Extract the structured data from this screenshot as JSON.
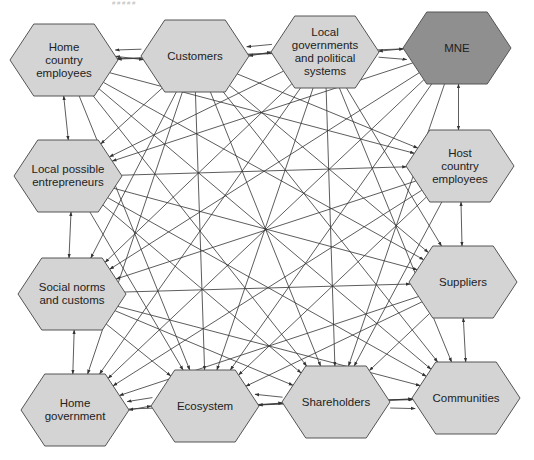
{
  "diagram": {
    "type": "stakeholder-network",
    "header_fragment": "# # # # #",
    "colors": {
      "node_fill": "#d4d4d4",
      "focal_node_fill": "#8f8f8f",
      "node_stroke": "#555555",
      "edge": "#333333",
      "text": "#222222",
      "background": "#ffffff"
    },
    "nodes": [
      {
        "id": "home-country-employees",
        "label": "Home\ncountry\nemployees",
        "cx": 64,
        "cy": 60,
        "focal": false
      },
      {
        "id": "customers",
        "label": "Customers",
        "cx": 195,
        "cy": 56,
        "focal": false
      },
      {
        "id": "local-governments",
        "label": "Local\ngovernments\nand political\nsystems",
        "cx": 325,
        "cy": 52,
        "focal": false
      },
      {
        "id": "mne",
        "label": "MNE",
        "cx": 457,
        "cy": 48,
        "focal": true
      },
      {
        "id": "local-possible-entrepreneurs",
        "label": "Local possible\nentrepreneurs",
        "cx": 68,
        "cy": 176,
        "focal": false
      },
      {
        "id": "host-country-employees",
        "label": "Host\ncountry\nemployees",
        "cx": 460,
        "cy": 166,
        "focal": false
      },
      {
        "id": "social-norms",
        "label": "Social norms\nand customs",
        "cx": 72,
        "cy": 294,
        "focal": false
      },
      {
        "id": "suppliers",
        "label": "Suppliers",
        "cx": 463,
        "cy": 282,
        "focal": false
      },
      {
        "id": "home-government",
        "label": "Home\ngovernment",
        "cx": 75,
        "cy": 410,
        "focal": false
      },
      {
        "id": "ecosystem",
        "label": "Ecosystem",
        "cx": 205,
        "cy": 406,
        "focal": false
      },
      {
        "id": "shareholders",
        "label": "Shareholders",
        "cx": 336,
        "cy": 402,
        "focal": false
      },
      {
        "id": "communities",
        "label": "Communities",
        "cx": 466,
        "cy": 398,
        "focal": false
      }
    ],
    "node_size": {
      "width": 108,
      "height": 72
    },
    "edges": [
      {
        "from": "home-country-employees",
        "to": "customers",
        "bidirectional": true
      },
      {
        "from": "customers",
        "to": "local-governments",
        "bidirectional": true
      },
      {
        "from": "local-governments",
        "to": "mne",
        "bidirectional": true
      },
      {
        "from": "customers",
        "to": "home-country-employees",
        "bidirectional": false
      },
      {
        "from": "local-governments",
        "to": "customers",
        "bidirectional": false
      },
      {
        "from": "local-governments",
        "to": "mne",
        "bidirectional": false
      },
      {
        "from": "home-country-employees",
        "to": "local-possible-entrepreneurs",
        "bidirectional": true
      },
      {
        "from": "local-possible-entrepreneurs",
        "to": "social-norms",
        "bidirectional": true
      },
      {
        "from": "social-norms",
        "to": "home-government",
        "bidirectional": true
      },
      {
        "from": "mne",
        "to": "host-country-employees",
        "bidirectional": true
      },
      {
        "from": "host-country-employees",
        "to": "suppliers",
        "bidirectional": true
      },
      {
        "from": "suppliers",
        "to": "communities",
        "bidirectional": true
      },
      {
        "from": "home-government",
        "to": "ecosystem",
        "bidirectional": true
      },
      {
        "from": "ecosystem",
        "to": "shareholders",
        "bidirectional": true
      },
      {
        "from": "shareholders",
        "to": "communities",
        "bidirectional": false
      },
      {
        "from": "shareholders",
        "to": "communities",
        "bidirectional": false
      },
      {
        "from": "ecosystem",
        "to": "home-government",
        "bidirectional": false
      },
      {
        "from": "shareholders",
        "to": "ecosystem",
        "bidirectional": false
      },
      {
        "from": "home-country-employees",
        "to": "host-country-employees",
        "bidirectional": false
      },
      {
        "from": "home-country-employees",
        "to": "suppliers",
        "bidirectional": false
      },
      {
        "from": "home-country-employees",
        "to": "shareholders",
        "bidirectional": false
      },
      {
        "from": "home-country-employees",
        "to": "ecosystem",
        "bidirectional": false
      },
      {
        "from": "home-country-employees",
        "to": "communities",
        "bidirectional": false
      },
      {
        "from": "customers",
        "to": "local-possible-entrepreneurs",
        "bidirectional": false
      },
      {
        "from": "customers",
        "to": "social-norms",
        "bidirectional": false
      },
      {
        "from": "customers",
        "to": "home-government",
        "bidirectional": false
      },
      {
        "from": "customers",
        "to": "ecosystem",
        "bidirectional": false
      },
      {
        "from": "customers",
        "to": "shareholders",
        "bidirectional": false
      },
      {
        "from": "customers",
        "to": "suppliers",
        "bidirectional": false
      },
      {
        "from": "customers",
        "to": "host-country-employees",
        "bidirectional": false
      },
      {
        "from": "customers",
        "to": "communities",
        "bidirectional": false
      },
      {
        "from": "local-governments",
        "to": "home-country-employees",
        "bidirectional": false
      },
      {
        "from": "local-governments",
        "to": "local-possible-entrepreneurs",
        "bidirectional": false
      },
      {
        "from": "local-governments",
        "to": "social-norms",
        "bidirectional": false
      },
      {
        "from": "local-governments",
        "to": "home-government",
        "bidirectional": false
      },
      {
        "from": "local-governments",
        "to": "ecosystem",
        "bidirectional": false
      },
      {
        "from": "local-governments",
        "to": "shareholders",
        "bidirectional": false
      },
      {
        "from": "local-governments",
        "to": "suppliers",
        "bidirectional": false
      },
      {
        "from": "local-governments",
        "to": "communities",
        "bidirectional": false
      },
      {
        "from": "mne",
        "to": "local-possible-entrepreneurs",
        "bidirectional": false
      },
      {
        "from": "mne",
        "to": "social-norms",
        "bidirectional": false
      },
      {
        "from": "mne",
        "to": "home-government",
        "bidirectional": false
      },
      {
        "from": "mne",
        "to": "ecosystem",
        "bidirectional": false
      },
      {
        "from": "mne",
        "to": "shareholders",
        "bidirectional": false
      },
      {
        "from": "mne",
        "to": "home-country-employees",
        "bidirectional": false
      },
      {
        "from": "local-possible-entrepreneurs",
        "to": "host-country-employees",
        "bidirectional": false
      },
      {
        "from": "local-possible-entrepreneurs",
        "to": "suppliers",
        "bidirectional": false
      },
      {
        "from": "local-possible-entrepreneurs",
        "to": "shareholders",
        "bidirectional": false
      },
      {
        "from": "local-possible-entrepreneurs",
        "to": "ecosystem",
        "bidirectional": false
      },
      {
        "from": "local-possible-entrepreneurs",
        "to": "communities",
        "bidirectional": false
      },
      {
        "from": "host-country-employees",
        "to": "social-norms",
        "bidirectional": false
      },
      {
        "from": "host-country-employees",
        "to": "home-government",
        "bidirectional": false
      },
      {
        "from": "host-country-employees",
        "to": "ecosystem",
        "bidirectional": false
      },
      {
        "from": "host-country-employees",
        "to": "shareholders",
        "bidirectional": false
      },
      {
        "from": "social-norms",
        "to": "suppliers",
        "bidirectional": false
      },
      {
        "from": "social-norms",
        "to": "shareholders",
        "bidirectional": false
      },
      {
        "from": "social-norms",
        "to": "ecosystem",
        "bidirectional": false
      },
      {
        "from": "social-norms",
        "to": "communities",
        "bidirectional": false
      },
      {
        "from": "suppliers",
        "to": "home-government",
        "bidirectional": false
      },
      {
        "from": "suppliers",
        "to": "ecosystem",
        "bidirectional": false
      },
      {
        "from": "suppliers",
        "to": "shareholders",
        "bidirectional": false
      },
      {
        "from": "home-government",
        "to": "communities",
        "bidirectional": false
      },
      {
        "from": "ecosystem",
        "to": "communities",
        "bidirectional": false
      }
    ]
  }
}
